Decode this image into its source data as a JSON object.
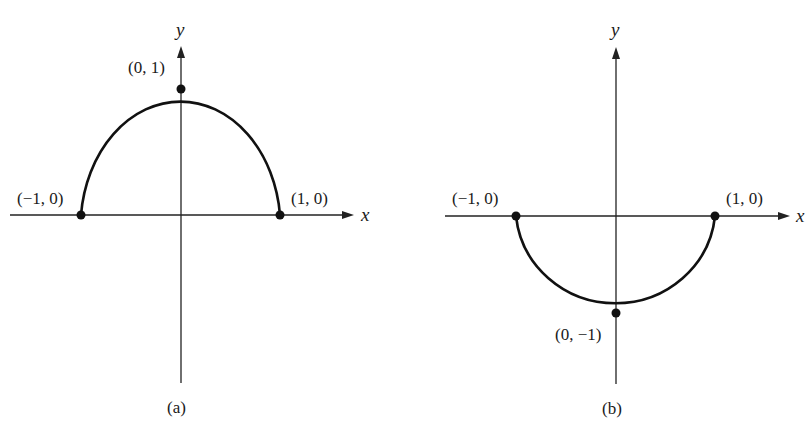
{
  "figure": {
    "panels": [
      {
        "id": "a",
        "caption": "(a)",
        "x_axis_label": "x",
        "y_axis_label": "y",
        "curve": "upper semicircle",
        "points": [
          {
            "label": "(−1, 0)",
            "x": -1,
            "y": 0
          },
          {
            "label": "(0, 1)",
            "x": 0,
            "y": 1
          },
          {
            "label": "(1, 0)",
            "x": 1,
            "y": 0
          }
        ]
      },
      {
        "id": "b",
        "caption": "(b)",
        "x_axis_label": "x",
        "y_axis_label": "y",
        "curve": "lower semicircle",
        "points": [
          {
            "label": "(−1, 0)",
            "x": -1,
            "y": 0
          },
          {
            "label": "(0, −1)",
            "x": 0,
            "y": -1
          },
          {
            "label": "(1, 0)",
            "x": 1,
            "y": 0
          }
        ]
      }
    ],
    "colors": {
      "ink": "#111111",
      "background": "#ffffff"
    }
  }
}
